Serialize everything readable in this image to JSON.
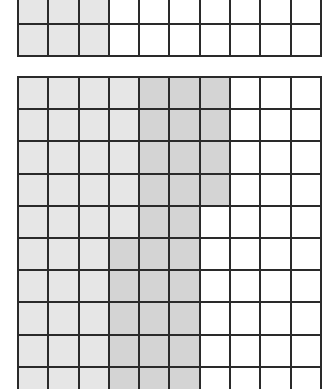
{
  "figure": {
    "type": "hundred-grid shading model",
    "colors": {
      "light_shade": "#e6e6e6",
      "dark_shade": "#d4d4d4",
      "unshaded": "#ffffff",
      "grid_line": "#2a2a2a"
    }
  },
  "top_grid": {
    "top": -9,
    "row_height": 32,
    "columns_visible": 10,
    "rows": [
      [
        "light",
        "light",
        "light",
        "white",
        "white",
        "white",
        "white",
        "white",
        "white",
        "white"
      ],
      [
        "light",
        "light",
        "light",
        "white",
        "white",
        "white",
        "white",
        "white",
        "white",
        "white"
      ]
    ]
  },
  "bottom_grid": {
    "top": 76,
    "row_height": 32.2,
    "columns_visible": 10,
    "rows": [
      [
        "light",
        "light",
        "light",
        "light",
        "dark",
        "dark",
        "dark",
        "white",
        "white",
        "white"
      ],
      [
        "light",
        "light",
        "light",
        "light",
        "dark",
        "dark",
        "dark",
        "white",
        "white",
        "white"
      ],
      [
        "light",
        "light",
        "light",
        "light",
        "dark",
        "dark",
        "dark",
        "white",
        "white",
        "white"
      ],
      [
        "light",
        "light",
        "light",
        "light",
        "dark",
        "dark",
        "dark",
        "white",
        "white",
        "white"
      ],
      [
        "light",
        "light",
        "light",
        "light",
        "dark",
        "dark",
        "white",
        "white",
        "white",
        "white"
      ],
      [
        "light",
        "light",
        "light",
        "dark",
        "dark",
        "dark",
        "white",
        "white",
        "white",
        "white"
      ],
      [
        "light",
        "light",
        "light",
        "dark",
        "dark",
        "dark",
        "white",
        "white",
        "white",
        "white"
      ],
      [
        "light",
        "light",
        "light",
        "dark",
        "dark",
        "dark",
        "white",
        "white",
        "white",
        "white"
      ],
      [
        "light",
        "light",
        "light",
        "dark",
        "dark",
        "dark",
        "white",
        "white",
        "white",
        "white"
      ],
      [
        "light",
        "light",
        "light",
        "dark",
        "dark",
        "dark",
        "white",
        "white",
        "white",
        "white"
      ]
    ]
  },
  "summary": {
    "top_grid_shaded_per_visible_row": 3,
    "bottom_grid_light_cells_visible": 34,
    "bottom_grid_dark_cells_visible": 28
  }
}
